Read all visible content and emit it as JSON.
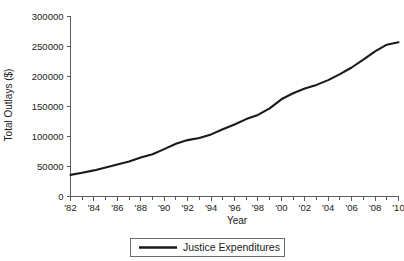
{
  "chart_data": {
    "type": "line",
    "title": "",
    "xlabel": "Year",
    "ylabel": "Total Outlays ($)",
    "xlim": [
      1982,
      2010
    ],
    "ylim": [
      0,
      300000
    ],
    "grid": false,
    "legend_position": "bottom-center",
    "y_ticks": [
      0,
      50000,
      100000,
      150000,
      200000,
      250000,
      300000
    ],
    "y_tick_labels": [
      "0",
      "50000",
      "100000",
      "150000",
      "200000",
      "250000",
      "300000"
    ],
    "x_ticks": [
      1982,
      1984,
      1986,
      1988,
      1990,
      1992,
      1994,
      1996,
      1998,
      2000,
      2002,
      2004,
      2006,
      2008,
      2010
    ],
    "x_tick_labels": [
      "'82",
      "'84",
      "'86",
      "'88",
      "'90",
      "'92",
      "'94",
      "'96",
      "'98",
      "'00",
      "'02",
      "'04",
      "'06",
      "'08",
      "'10"
    ],
    "x_minor_tick_interval": 1,
    "series": [
      {
        "name": "Justice Expenditures",
        "color": "#1a1a1a",
        "x": [
          1982,
          1983,
          1984,
          1985,
          1986,
          1987,
          1988,
          1989,
          1990,
          1991,
          1992,
          1993,
          1994,
          1995,
          1996,
          1997,
          1998,
          1999,
          2000,
          2001,
          2002,
          2003,
          2004,
          2005,
          2006,
          2007,
          2008,
          2009,
          2010
        ],
        "values": [
          36000,
          39500,
          43500,
          48500,
          53500,
          58500,
          65000,
          70500,
          79000,
          88000,
          94000,
          97500,
          103500,
          112000,
          120000,
          129000,
          136000,
          147000,
          162000,
          172000,
          180000,
          186000,
          194000,
          204000,
          215000,
          228000,
          242000,
          253000,
          257000
        ]
      }
    ],
    "legend": [
      {
        "label": "Justice Expenditures",
        "color": "#1a1a1a"
      }
    ]
  },
  "axes": {
    "x_title": "Year",
    "y_title": "Total Outlays ($)"
  },
  "colors": {
    "series": "#1a1a1a",
    "axis": "#5c5c5c",
    "legend_border": "#6b6b6b",
    "background": "#ffffff"
  }
}
